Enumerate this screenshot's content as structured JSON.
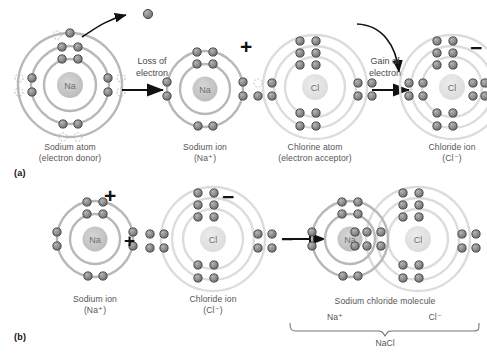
{
  "figure": {
    "panels": [
      "(a)",
      "(b)"
    ]
  },
  "colors": {
    "electron_fill": "#8c8c8c",
    "electron_stroke": "#4a4a4a",
    "shell_na": "#b3b3b3",
    "shell_cl": "#d8d8d8",
    "nucleus_na": "#c6c6c6",
    "nucleus_cl": "#e0e0e0",
    "arrow": "#111111",
    "text": "#555555",
    "background": "#ffffff"
  },
  "panel_a": {
    "tag": "(a)",
    "sodium_atom": {
      "nucleus_label": "Na",
      "caption_line1": "Sodium atom",
      "caption_line2": "(electron donor)",
      "shells": 3,
      "shell_electron_counts": [
        2,
        8,
        1
      ],
      "outer_electron_state": "leaving",
      "charge": ""
    },
    "transfer_loss": {
      "line1": "Loss of",
      "line2": "electron",
      "arrow": "straight-right-arrow",
      "curved_arrow": "electron-escape-arrow"
    },
    "sodium_ion": {
      "nucleus_label": "Na",
      "caption_line1": "Sodium ion",
      "caption_line2": "(Na⁺)",
      "shells": 2,
      "shell_electron_counts": [
        2,
        8
      ],
      "charge": "+"
    },
    "chlorine_atom": {
      "nucleus_label": "Cl",
      "caption_line1": "Chlorine atom",
      "caption_line2": "(electron acceptor)",
      "shells": 3,
      "shell_electron_counts": [
        2,
        8,
        7
      ],
      "outer_electron_state": "vacancy",
      "charge": ""
    },
    "transfer_gain": {
      "line1": "Gain of",
      "line2": "electron",
      "arrow": "straight-right-arrow",
      "curved_arrow": "electron-capture-arrow"
    },
    "chloride_ion": {
      "nucleus_label": "Cl",
      "caption_line1": "Chloride ion",
      "caption_line2": "(Cl⁻)",
      "shells": 3,
      "shell_electron_counts": [
        2,
        8,
        8
      ],
      "charge": "−"
    }
  },
  "panel_b": {
    "tag": "(b)",
    "sodium_ion": {
      "nucleus_label": "Na",
      "caption_line1": "Sodium ion",
      "caption_line2": "(Na⁺)",
      "charge": "+"
    },
    "operator": "+",
    "chloride_ion": {
      "nucleus_label": "Cl",
      "caption_line1": "Chloride ion",
      "caption_line2": "(Cl⁻)",
      "charge": "−"
    },
    "arrow": "straight-right-arrow",
    "molecule": {
      "caption": "Sodium chloride molecule",
      "left_nucleus_label": "Na",
      "right_nucleus_label": "Cl",
      "bracket_left_label": "Na⁺",
      "bracket_right_label": "Cl⁻",
      "bracket_bottom_label": "NaCl"
    }
  }
}
